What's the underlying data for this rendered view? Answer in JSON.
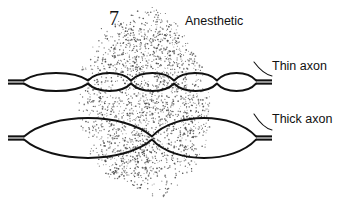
{
  "figure": {
    "number": "7",
    "type": "scientific-diagram",
    "background_color": "#ffffff",
    "ink_color": "#111111",
    "stipple_color": "#4a4a4a"
  },
  "labels": {
    "anesthetic": "Anesthetic",
    "thin_axon": "Thin axon",
    "thick_axon": "Thick axon"
  },
  "anesthetic_region": {
    "name": "stippled-blob",
    "description": "irregular stippled oval representing anesthetic diffusion zone",
    "bounds": {
      "x": 78,
      "y": 5,
      "width": 135,
      "height": 196
    },
    "center": {
      "x": 145,
      "y": 103
    },
    "dot_count": 2600,
    "dot_radius": 0.62
  },
  "thin_axon": {
    "name": "thin-axon",
    "y_center": 82,
    "x_start": 8,
    "x_end": 272,
    "segment_half_height": 11.5,
    "node_positions": [
      88,
      131,
      174,
      217
    ],
    "internode_count": 5,
    "segments_under_anesthetic": 3
  },
  "thick_axon": {
    "name": "thick-axon",
    "y_center": 138,
    "x_start": 8,
    "x_end": 272,
    "segment_half_height": 26,
    "node_positions": [
      152
    ],
    "internode_count": 2,
    "segments_under_anesthetic": 1
  },
  "callouts": [
    {
      "name": "thin-axon-callout",
      "from": {
        "x": 254,
        "y": 62
      },
      "to": {
        "x": 272,
        "y": 76
      }
    },
    {
      "name": "thick-axon-callout",
      "from": {
        "x": 254,
        "y": 114
      },
      "to": {
        "x": 272,
        "y": 130
      }
    }
  ]
}
